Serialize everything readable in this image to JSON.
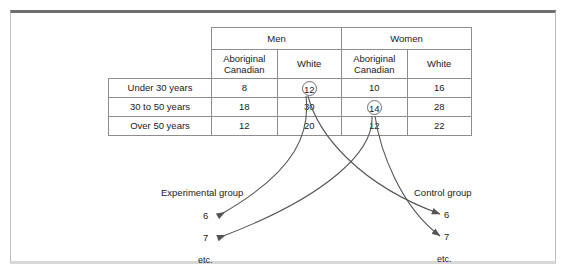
{
  "figure": {
    "table": {
      "group_headers": [
        "Men",
        "Women"
      ],
      "sub_headers": [
        "Aboriginal Canadian",
        "White",
        "Aboriginal Canadian",
        "White"
      ],
      "sub_headers_lines": [
        [
          "Aboriginal",
          "Canadian"
        ],
        [
          "White",
          ""
        ],
        [
          "Aboriginal",
          "Canadian"
        ],
        [
          "White",
          ""
        ]
      ],
      "rows": [
        {
          "label": "Under 30 years",
          "values": [
            "8",
            "12",
            "10",
            "16"
          ]
        },
        {
          "label": "30 to 50 years",
          "values": [
            "18",
            "30",
            "14",
            "28"
          ]
        },
        {
          "label": "Over 50 years",
          "values": [
            "12",
            "20",
            "12",
            "22"
          ]
        }
      ],
      "circled_cells": [
        {
          "row": 0,
          "col": 1,
          "value": "12"
        },
        {
          "row": 1,
          "col": 2,
          "value": "14"
        }
      ]
    },
    "annotations": {
      "experimental": {
        "title": "Experimental group",
        "values": [
          "6",
          "7"
        ],
        "etc": "etc."
      },
      "control": {
        "title": "Control group",
        "values": [
          "6",
          "7"
        ],
        "etc": "etc."
      }
    },
    "colors": {
      "line": "#555555",
      "table_border": "#8d8d8d",
      "frame_top": "#6f6f6f",
      "text": "#1a1a1a",
      "background": "#ffffff"
    }
  }
}
